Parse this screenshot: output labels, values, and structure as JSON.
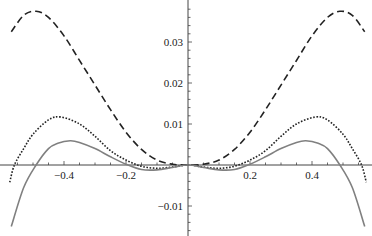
{
  "chart_data": {
    "type": "line",
    "title": "",
    "xlabel": "",
    "ylabel": "",
    "xlim": [
      -0.575,
      0.575
    ],
    "ylim": [
      -0.0165,
      0.04
    ],
    "grid": false,
    "legend": null,
    "x_ticks": [
      {
        "value": -0.4,
        "label": "−0.4"
      },
      {
        "value": -0.2,
        "label": "−0.2"
      },
      {
        "value": 0.2,
        "label": "0.2"
      },
      {
        "value": 0.4,
        "label": "0.4"
      }
    ],
    "y_ticks": [
      {
        "value": 0.03,
        "label": "0.03"
      },
      {
        "value": 0.02,
        "label": "0.02"
      },
      {
        "value": 0.01,
        "label": "0.01"
      },
      {
        "value": -0.01,
        "label": "−0.01"
      }
    ],
    "series": [
      {
        "name": "dashed",
        "style": "dashed",
        "color": "#222222",
        "symmetric": true,
        "x": [
          0,
          0.05,
          0.1,
          0.15,
          0.2,
          0.25,
          0.3,
          0.35,
          0.4,
          0.45,
          0.49,
          0.53,
          0.57
        ],
        "y": [
          0,
          0.0002,
          0.0012,
          0.0038,
          0.008,
          0.0135,
          0.0195,
          0.0255,
          0.0315,
          0.036,
          0.0375,
          0.0365,
          0.0325
        ]
      },
      {
        "name": "dotted",
        "style": "dotted",
        "color": "#222222",
        "symmetric": true,
        "x": [
          0,
          0.05,
          0.1,
          0.15,
          0.2,
          0.25,
          0.3,
          0.35,
          0.41,
          0.45,
          0.5,
          0.53,
          0.56,
          0.575
        ],
        "y": [
          0,
          -0.0005,
          -0.0008,
          -0.0003,
          0.0012,
          0.0035,
          0.007,
          0.01,
          0.0117,
          0.011,
          0.0075,
          0.004,
          0.0,
          -0.0042
        ]
      },
      {
        "name": "solid",
        "style": "solid",
        "color": "#808080",
        "symmetric": true,
        "x": [
          0,
          0.05,
          0.1,
          0.15,
          0.2,
          0.25,
          0.3,
          0.35,
          0.38,
          0.42,
          0.45,
          0.49,
          0.53,
          0.57
        ],
        "y": [
          0,
          -0.0006,
          -0.0012,
          -0.0011,
          0.0002,
          0.002,
          0.004,
          0.0055,
          0.0059,
          0.0053,
          0.004,
          0.0,
          -0.0055,
          -0.015
        ]
      }
    ]
  }
}
